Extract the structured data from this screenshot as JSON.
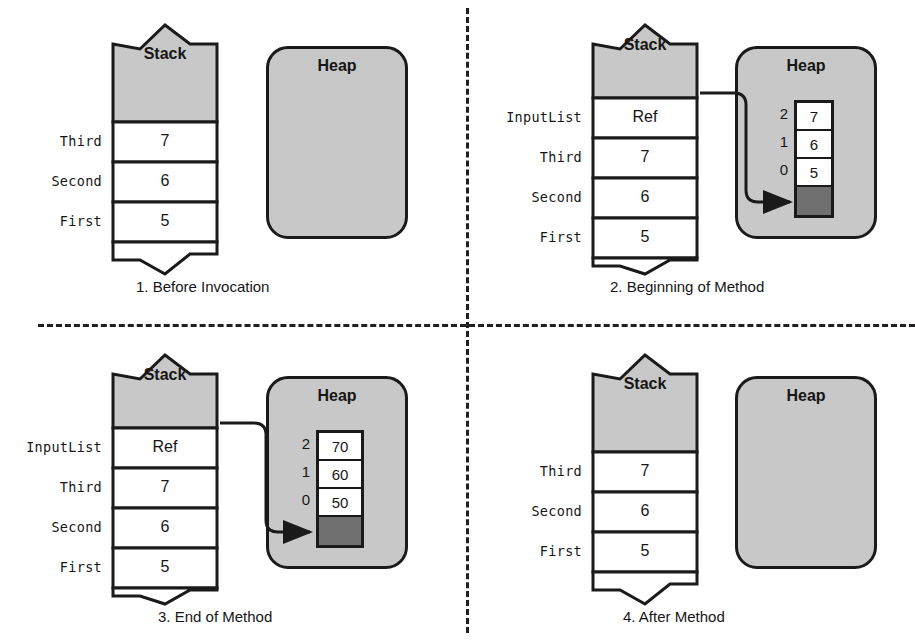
{
  "figure": {
    "stack_header_label": "Stack",
    "heap_header_label": "Heap",
    "reference_value_label": "Ref"
  },
  "panels": [
    {
      "id": "panel-1",
      "caption": "1. Before Invocation",
      "stack": {
        "header": "Stack",
        "rows": [
          {
            "label": "Third",
            "value": "7"
          },
          {
            "label": "Second",
            "value": "6"
          },
          {
            "label": "First",
            "value": "5"
          }
        ]
      },
      "heap": {
        "title": "Heap",
        "has_array": false,
        "array": {
          "indices": [],
          "values": []
        }
      },
      "pointer": false
    },
    {
      "id": "panel-2",
      "caption": "2. Beginning of Method",
      "stack": {
        "header": "Stack",
        "rows": [
          {
            "label": "InputList",
            "value": "Ref"
          },
          {
            "label": "Third",
            "value": "7"
          },
          {
            "label": "Second",
            "value": "6"
          },
          {
            "label": "First",
            "value": "5"
          }
        ]
      },
      "heap": {
        "title": "Heap",
        "has_array": true,
        "array": {
          "indices": [
            "2",
            "1",
            "0",
            ""
          ],
          "values": [
            "7",
            "6",
            "5",
            ""
          ]
        }
      },
      "pointer": true
    },
    {
      "id": "panel-3",
      "caption": "3. End of Method",
      "stack": {
        "header": "Stack",
        "rows": [
          {
            "label": "InputList",
            "value": "Ref"
          },
          {
            "label": "Third",
            "value": "7"
          },
          {
            "label": "Second",
            "value": "6"
          },
          {
            "label": "First",
            "value": "5"
          }
        ]
      },
      "heap": {
        "title": "Heap",
        "has_array": true,
        "array": {
          "indices": [
            "2",
            "1",
            "0",
            ""
          ],
          "values": [
            "70",
            "60",
            "50",
            ""
          ]
        }
      },
      "pointer": true
    },
    {
      "id": "panel-4",
      "caption": "4. After Method",
      "stack": {
        "header": "Stack",
        "rows": [
          {
            "label": "Third",
            "value": "7"
          },
          {
            "label": "Second",
            "value": "6"
          },
          {
            "label": "First",
            "value": "5"
          }
        ]
      },
      "heap": {
        "title": "Heap",
        "has_array": false,
        "array": {
          "indices": [],
          "values": []
        }
      },
      "pointer": false
    }
  ],
  "colors": {
    "stroke": "#1a1a1a",
    "stack_header_fill": "#c8c8c8",
    "heap_fill": "#c8c8c8",
    "cell_fill": "#ffffff",
    "dark_cell_fill": "#707070",
    "divider": "#231f20",
    "text": "#161616"
  }
}
